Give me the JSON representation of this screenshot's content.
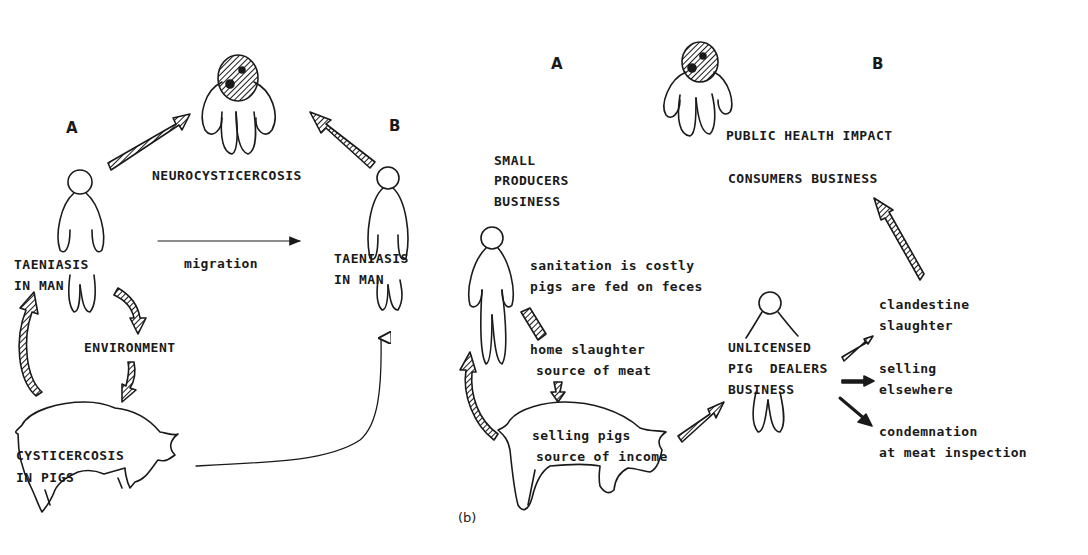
{
  "panel_a": {
    "label_a": "A",
    "label_b": "B",
    "neurocysticercosis": "NEUROCYSTICERCOSIS",
    "taeniasis_a_line1": "TAENIASIS",
    "taeniasis_a_line2": "IN MAN",
    "taeniasis_b_line1": "TAENIASIS",
    "taeniasis_b_line2": "IN MAN",
    "migration": "migration",
    "environment": "ENVIRONMENT",
    "cysticercosis_line1": "CYSTICERCOSIS",
    "cysticercosis_line2": "IN PIGS"
  },
  "panel_b": {
    "caption": "(b)",
    "label_a": "A",
    "label_b": "B",
    "public_health_impact": "PUBLIC HEALTH IMPACT",
    "consumers_business": "CONSUMERS BUSINESS",
    "small_producers_line1": "SMALL",
    "small_producers_line2": "PRODUCERS",
    "small_producers_line3": "BUSINESS",
    "sanitation_line1": "sanitation is costly",
    "sanitation_line2": "pigs are fed on feces",
    "home_slaughter_line1": "home slaughter",
    "home_slaughter_line2": "source of meat",
    "selling_pigs_line1": "selling pigs",
    "selling_pigs_line2": "source of income",
    "dealers_line1": "UNLICENSED",
    "dealers_line2": "PIG  DEALERS",
    "dealers_line3": "BUSINESS",
    "outcome_1_line1": "clandestine",
    "outcome_1_line2": "slaughter",
    "outcome_2_line1": "selling",
    "outcome_2_line2": "elsewhere",
    "outcome_3_line1": "condemnation",
    "outcome_3_line2": "at meat inspection"
  },
  "colors": {
    "ink": "#1a1a1a",
    "background": "#ffffff"
  }
}
